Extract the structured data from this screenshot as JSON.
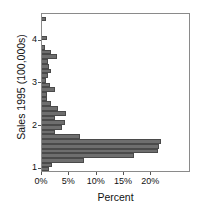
{
  "chart_data": {
    "type": "bar",
    "orientation": "horizontal",
    "title": "",
    "subtitle": "",
    "xlabel": "Percent",
    "ylabel": "Sales 1995 (100,000s)",
    "xlim": [
      0,
      26.9
    ],
    "ylim": [
      0.95,
      4.62
    ],
    "grid": false,
    "legend": null,
    "bar_color": "#6e6e6e",
    "bar_edge_color": "#4a4a4a",
    "frame_color": "#8a8a8a",
    "xtick_labels": [
      "0%",
      "5%",
      "10%",
      "15%",
      "20%"
    ],
    "xtick_values": [
      0,
      5,
      10,
      15,
      20
    ],
    "ytick_labels": [
      "1",
      "2",
      "3",
      "4"
    ],
    "ytick_values": [
      1,
      2,
      3,
      4
    ],
    "bin_width": 0.11,
    "categories": [
      "4.50",
      "4.39",
      "4.28",
      "4.17",
      "4.06",
      "3.95",
      "3.84",
      "3.73",
      "3.62",
      "3.51",
      "3.40",
      "3.29",
      "3.18",
      "3.07",
      "2.96",
      "2.85",
      "2.74",
      "2.63",
      "2.52",
      "2.41",
      "2.30",
      "2.19",
      "2.08",
      "1.97",
      "1.86",
      "1.75",
      "1.64",
      "1.53",
      "1.42",
      "1.31",
      "1.20",
      "1.09",
      "1.00"
    ],
    "values": [
      0.8,
      0.0,
      0.0,
      0.0,
      0.9,
      0.0,
      0.5,
      1.6,
      2.7,
      1.1,
      1.3,
      1.6,
      1.1,
      0.7,
      1.4,
      2.4,
      0.9,
      0.9,
      1.6,
      3.0,
      4.4,
      2.4,
      4.2,
      3.6,
      2.4,
      6.9,
      21.8,
      21.5,
      21.3,
      16.9,
      7.6,
      1.8,
      1.3
    ]
  }
}
